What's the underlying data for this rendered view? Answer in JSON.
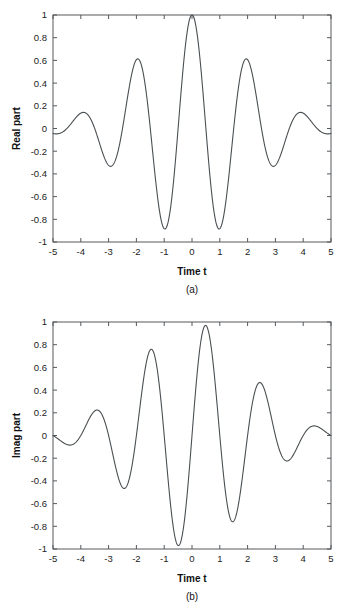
{
  "figure": {
    "panels": [
      {
        "id": "a",
        "caption": "(a)",
        "xlabel": "Time t",
        "ylabel": "Real part",
        "ytick_labels": [
          "1",
          "0.8",
          "0.6",
          "0.4",
          "0.2",
          "0",
          "-0.2",
          "-0.4",
          "-0.6",
          "-0.8",
          "-1"
        ],
        "xtick_labels": [
          "-5",
          "-4",
          "-3",
          "-2",
          "-1",
          "0",
          "1",
          "2",
          "3",
          "4",
          "5"
        ]
      },
      {
        "id": "b",
        "caption": "(b)",
        "xlabel": "Time t",
        "ylabel": "Imag part",
        "ytick_labels": [
          "1",
          "0.8",
          "0.6",
          "0.4",
          "0.2",
          "0",
          "-0.2",
          "-0.4",
          "-0.6",
          "-0.8",
          "-1"
        ],
        "xtick_labels": [
          "-5",
          "-4",
          "-3",
          "-2",
          "-1",
          "0",
          "1",
          "2",
          "3",
          "4",
          "5"
        ]
      }
    ]
  },
  "chart_data": [
    {
      "type": "line",
      "title": "",
      "caption": "(a)",
      "xlabel": "Time t",
      "ylabel": "Real part",
      "xlim": [
        -5,
        5
      ],
      "ylim": [
        -1,
        1
      ],
      "xticks": [
        -5,
        -4,
        -3,
        -2,
        -1,
        0,
        1,
        2,
        3,
        4,
        5
      ],
      "yticks": [
        -1,
        -0.8,
        -0.6,
        -0.4,
        -0.2,
        0,
        0.2,
        0.4,
        0.6,
        0.8,
        1
      ],
      "grid": false,
      "legend": "none",
      "series": [
        {
          "name": "Real part",
          "formula": "cos(pi*t)*exp(-t^2/8)",
          "x": [
            -5,
            -4.75,
            -4.5,
            -4.25,
            -4,
            -3.75,
            -3.5,
            -3.25,
            -3,
            -2.75,
            -2.5,
            -2.25,
            -2,
            -1.75,
            -1.5,
            -1.25,
            -1,
            -0.75,
            -0.5,
            -0.25,
            0,
            0.25,
            0.5,
            0.75,
            1,
            1.25,
            1.5,
            1.75,
            2,
            2.25,
            2.5,
            2.75,
            3,
            3.25,
            3.5,
            3.75,
            4,
            4.25,
            4.5,
            4.75,
            5
          ],
          "y": [
            -0.044,
            -0.043,
            0.0,
            0.1,
            0.135,
            0.1,
            0.0,
            -0.184,
            -0.26,
            -0.184,
            0.0,
            0.3,
            0.424,
            0.3,
            0.0,
            -0.45,
            -0.637,
            -0.45,
            0.0,
            0.658,
            1.0,
            0.658,
            0.0,
            -0.45,
            -0.637,
            -0.45,
            0.0,
            0.3,
            0.424,
            0.3,
            0.0,
            -0.184,
            -0.26,
            -0.184,
            0.0,
            0.1,
            0.135,
            0.1,
            0.0,
            -0.043,
            -0.044
          ],
          "key_extrema": [
            {
              "t": -5,
              "value": -0.05
            },
            {
              "t": -4,
              "value": 0.15
            },
            {
              "t": -3,
              "value": -0.34
            },
            {
              "t": -2,
              "value": 0.61
            },
            {
              "t": -1,
              "value": -0.89
            },
            {
              "t": 0,
              "value": 1.0
            },
            {
              "t": 1,
              "value": -0.89
            },
            {
              "t": 2,
              "value": 0.61
            },
            {
              "t": 3,
              "value": -0.34
            },
            {
              "t": 4,
              "value": 0.15
            },
            {
              "t": 5,
              "value": -0.05
            }
          ]
        }
      ]
    },
    {
      "type": "line",
      "title": "",
      "caption": "(b)",
      "xlabel": "Time t",
      "ylabel": "Imag part",
      "xlim": [
        -5,
        5
      ],
      "ylim": [
        -1,
        1
      ],
      "xticks": [
        -5,
        -4,
        -3,
        -2,
        -1,
        0,
        1,
        2,
        3,
        4,
        5
      ],
      "yticks": [
        -1,
        -0.8,
        -0.6,
        -0.4,
        -0.2,
        0,
        0.2,
        0.4,
        0.6,
        0.8,
        1
      ],
      "grid": false,
      "legend": "none",
      "series": [
        {
          "name": "Imag part",
          "formula": "sin(pi*t)*exp(-t^2/8)",
          "x": [
            -5,
            -4.75,
            -4.5,
            -4.25,
            -4,
            -3.75,
            -3.5,
            -3.25,
            -3,
            -2.75,
            -2.5,
            -2.25,
            -2,
            -1.75,
            -1.5,
            -1.25,
            -1,
            -0.75,
            -0.5,
            -0.25,
            0,
            0.25,
            0.5,
            0.75,
            1,
            1.25,
            1.5,
            1.75,
            2,
            2.25,
            2.5,
            2.75,
            3,
            3.25,
            3.5,
            3.75,
            4,
            4.25,
            4.5,
            4.75,
            5
          ],
          "y": [
            0.0,
            -0.062,
            -0.088,
            -0.062,
            0.0,
            0.1,
            0.142,
            0.1,
            0.0,
            -0.184,
            -0.26,
            -0.184,
            0.0,
            0.3,
            0.424,
            0.3,
            0.0,
            -0.45,
            -0.637,
            -0.45,
            0.0,
            0.658,
            0.93,
            0.658,
            0.0,
            -0.45,
            -0.637,
            -0.45,
            0.0,
            0.3,
            0.424,
            0.3,
            0.0,
            -0.184,
            -0.26,
            -0.184,
            0.0,
            0.062,
            0.088,
            0.062,
            0.0
          ],
          "key_extrema": [
            {
              "t": -5,
              "value": 0.0
            },
            {
              "t": -4.5,
              "value": -0.09
            },
            {
              "t": -3.5,
              "value": 0.22
            },
            {
              "t": -2.5,
              "value": -0.47
            },
            {
              "t": -1.5,
              "value": 0.75
            },
            {
              "t": -0.5,
              "value": -0.97
            },
            {
              "t": 0.5,
              "value": 0.96
            },
            {
              "t": 1.5,
              "value": -0.76
            },
            {
              "t": 2.5,
              "value": 0.46
            },
            {
              "t": 3.5,
              "value": -0.23
            },
            {
              "t": 4.5,
              "value": 0.08
            },
            {
              "t": 5,
              "value": -0.02
            }
          ]
        }
      ]
    }
  ]
}
